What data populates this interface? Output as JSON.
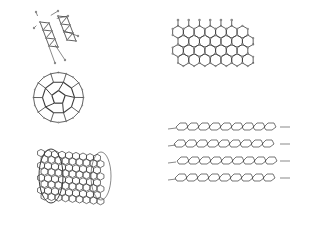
{
  "figure": {
    "panels": [
      {
        "id": "diamond",
        "label": "diamond lattice"
      },
      {
        "id": "graphene",
        "label": "graphene sheet"
      },
      {
        "id": "fullerene",
        "label": "C60 fullerene"
      },
      {
        "id": "nanotube",
        "label": "carbon nanotube"
      },
      {
        "id": "graphite",
        "label": "graphite layers"
      }
    ],
    "colors": {
      "background": "#ffffff",
      "stroke": "#3a3a3a",
      "atom": "#8a8a8a"
    }
  }
}
